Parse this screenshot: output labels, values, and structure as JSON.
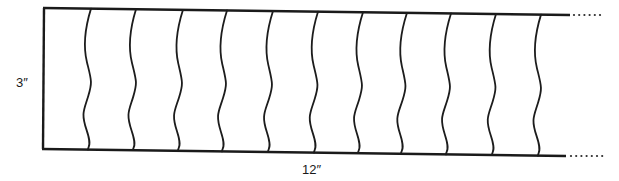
{
  "diagram": {
    "labels": {
      "height": "3″",
      "width": "12″"
    },
    "stroke_color": "#1a1a1a",
    "background": "#ffffff",
    "frame": {
      "top_left": [
        44,
        8
      ],
      "top_right_end": [
        570,
        15
      ],
      "bottom_left": [
        43,
        149
      ],
      "bottom_right_end": [
        566,
        156
      ]
    },
    "continuation": {
      "style": "dotted",
      "top_dots": 6,
      "bottom_dots": 7
    },
    "wavy_lines": [
      {
        "top_x": 91,
        "bottom_x": 88
      },
      {
        "top_x": 136,
        "bottom_x": 133
      },
      {
        "top_x": 183,
        "bottom_x": 178
      },
      {
        "top_x": 227,
        "bottom_x": 222
      },
      {
        "top_x": 273,
        "bottom_x": 268
      },
      {
        "top_x": 318,
        "bottom_x": 314
      },
      {
        "top_x": 363,
        "bottom_x": 358
      },
      {
        "top_x": 407,
        "bottom_x": 401
      },
      {
        "top_x": 451,
        "bottom_x": 446
      },
      {
        "top_x": 496,
        "bottom_x": 492
      },
      {
        "top_x": 541,
        "bottom_x": 538
      }
    ],
    "wavy_line_count": 11
  }
}
